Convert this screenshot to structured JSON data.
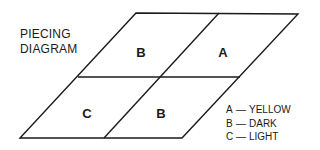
{
  "title": {
    "line1": "PIECING",
    "line2": "DIAGRAM"
  },
  "cells": [
    {
      "id": "top-left",
      "label": "B"
    },
    {
      "id": "top-right",
      "label": "A"
    },
    {
      "id": "bottom-left",
      "label": "C"
    },
    {
      "id": "bottom-right",
      "label": "B"
    }
  ],
  "legend": [
    {
      "key": "A",
      "dash": "—",
      "value": "YELLOW"
    },
    {
      "key": "B",
      "dash": "—",
      "value": "DARK"
    },
    {
      "key": "C",
      "dash": "—",
      "value": "LIGHT"
    }
  ],
  "colors": {
    "line": "#1a1a1a",
    "background": "#ffffff"
  }
}
